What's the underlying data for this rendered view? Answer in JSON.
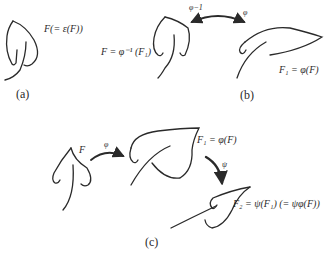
{
  "panels": {
    "a": {
      "caption": "(a)",
      "label": "F(= ε(F))"
    },
    "b": {
      "caption": "(b)",
      "left_label": "F = φ⁻¹ (F₁)",
      "right_label": "F₁ = φ(F)",
      "arrow_left_label": "φ−1",
      "arrow_right_label": "φ"
    },
    "c": {
      "caption": "(c)",
      "leaf1_label": "F",
      "arrow1_label": "φ",
      "leaf2_label": "F₁ = φ(F)",
      "arrow2_label": "ψ",
      "leaf3_label": "F₂ = ψ(F₁) (= ψφ(F))"
    }
  },
  "colors": {
    "stroke": "#2a2a2a",
    "background": "#ffffff"
  }
}
